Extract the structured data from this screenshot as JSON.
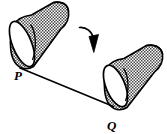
{
  "figure": {
    "background_color": "#ffffff",
    "stroke_color": "#000000",
    "fill_color": "#ffffff",
    "stipple_color": "#3a3a3a",
    "width": 167,
    "height": 134,
    "labels": [
      {
        "id": "label-p",
        "text": "P",
        "x": 18,
        "y": 80,
        "style": "italic-bold-serif"
      },
      {
        "id": "label-q",
        "text": "Q",
        "x": 110,
        "y": 130,
        "style": "italic-bold-serif"
      }
    ],
    "cylinders": [
      {
        "id": "cylinder-left",
        "name": "left-cylinder",
        "description": "Tilted stippled tube at upper left, open elliptical face at lower-left, body sweeping to upper-right",
        "face_center_x": 22,
        "face_center_y": 44,
        "face_rx": 9,
        "face_ry": 24,
        "face_rotation_deg": -22
      },
      {
        "id": "cylinder-right",
        "name": "right-cylinder",
        "description": "Tilted stippled tube at lower right, open elliptical face at lower-left, body sweeping to upper-right",
        "face_center_x": 115,
        "face_center_y": 86,
        "face_rx": 9,
        "face_ry": 22,
        "face_rotation_deg": -22
      }
    ],
    "connector": {
      "id": "connector-pq",
      "name": "segment-p-to-q",
      "from_x": 20,
      "from_y": 68,
      "to_x": 113,
      "to_y": 106
    },
    "motion_arrow": {
      "id": "motion-arrow",
      "name": "curved-motion-arrow",
      "description": "Curved arrow arcing from upper-left to lower-right between the two cylinders, solid filled head pointing down",
      "start_x": 80,
      "start_y": 27,
      "end_x": 95,
      "end_y": 52
    }
  }
}
